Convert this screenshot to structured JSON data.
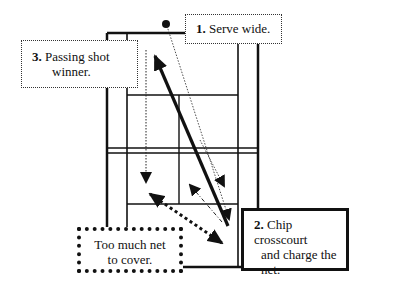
{
  "diagram": {
    "court": {
      "line_color": "#111111",
      "background": "#ffffff"
    },
    "callouts": [
      {
        "step": "1.",
        "lines": [
          "Serve wide."
        ]
      },
      {
        "step": "2.",
        "lines": [
          "Chip crosscourt",
          "and charge the",
          "net."
        ]
      },
      {
        "step": "3.",
        "lines": [
          "Passing shot",
          "winner."
        ]
      },
      {
        "step": "",
        "lines": [
          "Too much net",
          "to cover."
        ]
      }
    ]
  }
}
